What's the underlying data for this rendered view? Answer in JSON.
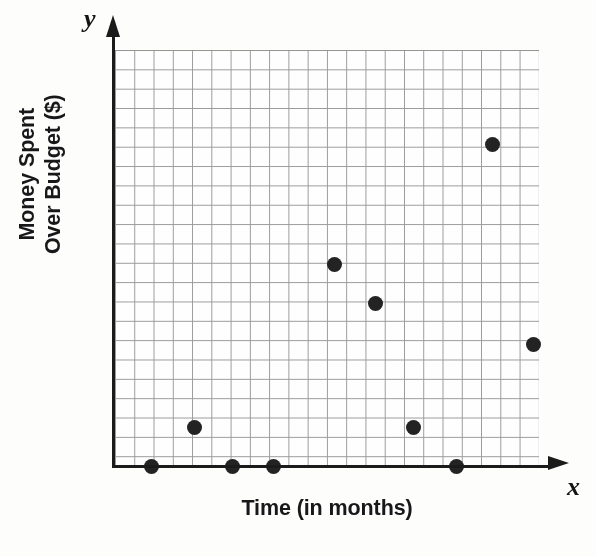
{
  "chart_data": {
    "type": "scatter",
    "title": "",
    "xlabel": "Time (in months)",
    "ylabel": "Money Spent Over Budget ($)",
    "ylabel_lines": [
      "Money Spent",
      "Over Budget ($)"
    ],
    "x_axis_letter": "x",
    "y_axis_letter": "y",
    "grid": true,
    "grid_columns": 22,
    "grid_rows": 21.5,
    "xlim": [
      0,
      22
    ],
    "ylim": [
      0,
      21.5
    ],
    "x_tick_labels": [],
    "y_tick_labels": [],
    "legend": null,
    "annotations": [],
    "point_color": "#232323",
    "grid_color": "#9a9a9a",
    "axis_color": "#1b1b1b",
    "points": [
      {
        "x": 1.9,
        "y": 0.0
      },
      {
        "x": 4.1,
        "y": 2.0
      },
      {
        "x": 6.1,
        "y": 0.0
      },
      {
        "x": 8.2,
        "y": 0.0
      },
      {
        "x": 11.4,
        "y": 10.4
      },
      {
        "x": 13.5,
        "y": 8.4
      },
      {
        "x": 15.5,
        "y": 2.0
      },
      {
        "x": 17.7,
        "y": 0.0
      },
      {
        "x": 19.6,
        "y": 16.6
      },
      {
        "x": 21.7,
        "y": 6.3
      }
    ]
  },
  "plot_geometry": {
    "left": 115,
    "top": 50,
    "width": 424,
    "height": 416
  }
}
